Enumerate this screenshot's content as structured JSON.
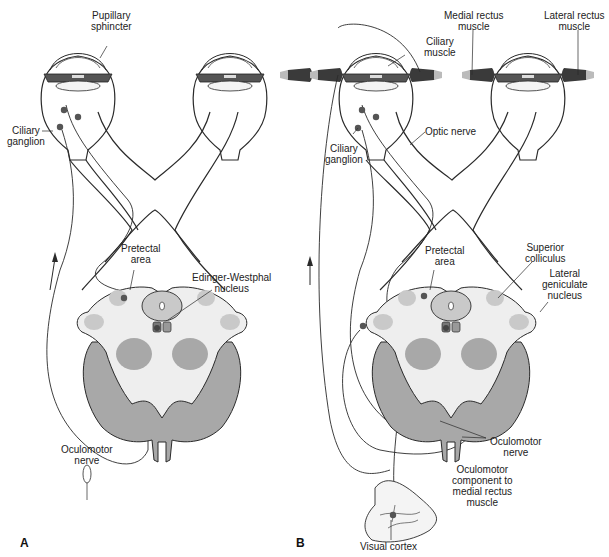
{
  "figure": {
    "panels": [
      {
        "id": "A",
        "letter": "A",
        "title": "Pupillary light reflex pathway",
        "labels": {
          "pupillary_sphincter": [
            "Pupillary",
            "sphincter"
          ],
          "ciliary_ganglion": [
            "Ciliary",
            "ganglion"
          ],
          "pretectal_area": [
            "Pretectal",
            "area"
          ],
          "edinger_westphal": [
            "Edinger-Westphal",
            "nucleus"
          ],
          "oculomotor_nerve": [
            "Oculomotor",
            "nerve"
          ]
        }
      },
      {
        "id": "B",
        "letter": "B",
        "title": "Accommodation-convergence pathway",
        "labels": {
          "medial_rectus": [
            "Medial rectus",
            "muscle"
          ],
          "lateral_rectus": [
            "Lateral rectus",
            "muscle"
          ],
          "ciliary_muscle": [
            "Ciliary",
            "muscle"
          ],
          "optic_nerve": [
            "Optic nerve"
          ],
          "ciliary_ganglion": [
            "Ciliary",
            "ganglion"
          ],
          "pretectal_area": [
            "Pretectal",
            "area"
          ],
          "superior_colliculus": [
            "Superior",
            "colliculus"
          ],
          "lateral_geniculate": [
            "Lateral",
            "geniculate",
            "nucleus"
          ],
          "oculomotor_nerve": [
            "Oculomotor",
            "nerve"
          ],
          "oculomotor_component": [
            "Oculomotor",
            "component to",
            "medial rectus",
            "muscle"
          ],
          "visual_cortex": [
            "Visual cortex"
          ]
        }
      }
    ],
    "colors": {
      "line": "#2a2a2a",
      "neuron_dot": "#555555",
      "midbrain_light": "#eeeeee",
      "midbrain_mid": "#c9c9c9",
      "midbrain_dark": "#a8a8a8",
      "muscle": "#444444"
    }
  }
}
